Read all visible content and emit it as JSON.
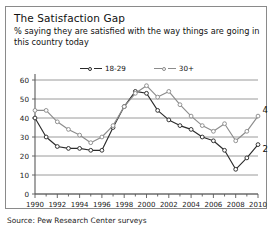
{
  "card": {
    "title": "The Satisfaction Gap",
    "subtitle": "% saying they are satisfied with the way things are going in this country today",
    "source": "Source: Pew Research Center surveys"
  },
  "colors": {
    "series_young": "#2b2b2b",
    "series_older": "#8c8c8c",
    "gridline": "#8f8f8f",
    "axis": "#5a5a5a",
    "border": "#8a8a8a",
    "text": "#111111",
    "background": "#ffffff"
  },
  "legend": {
    "position": "top-center",
    "entries": [
      {
        "label": "18-29",
        "marker": "open-circle",
        "color": "#2b2b2b"
      },
      {
        "label": "30+",
        "marker": "open-circle",
        "color": "#8c8c8c"
      }
    ]
  },
  "chart_data": {
    "type": "line",
    "title": "The Satisfaction Gap",
    "subtitle": "% saying they are satisfied with the way things are going in this country today",
    "xlabel": "",
    "ylabel": "",
    "xlim": [
      1990,
      2010
    ],
    "ylim": [
      0,
      60
    ],
    "yticks": [
      0,
      10,
      20,
      30,
      40,
      50,
      60
    ],
    "xticks": [
      1990,
      1992,
      1994,
      1996,
      1998,
      2000,
      2002,
      2004,
      2006,
      2008,
      2010
    ],
    "xtick_labels": [
      "1990",
      "1992",
      "1994",
      "1996",
      "1998",
      "2000",
      "2002",
      "2004",
      "2006",
      "2008",
      "2010"
    ],
    "ytick_labels": [
      "0",
      "10",
      "20",
      "30",
      "40",
      "50",
      "60"
    ],
    "grid": "horizontal",
    "legend": "top-center",
    "x": [
      1990,
      1991,
      1992,
      1993,
      1994,
      1995,
      1996,
      1997,
      1998,
      1999,
      2000,
      2001,
      2002,
      2003,
      2004,
      2005,
      2006,
      2007,
      2008,
      2009,
      2010
    ],
    "series": [
      {
        "name": "18-29",
        "color": "#2b2b2b",
        "values": [
          40,
          30,
          25,
          24,
          24,
          23,
          23,
          35,
          46,
          54,
          53,
          44,
          39,
          36,
          34,
          30,
          28,
          23,
          13,
          19,
          26
        ],
        "end_label": "26"
      },
      {
        "name": "30+",
        "color": "#8c8c8c",
        "values": [
          44,
          44,
          38,
          34,
          31,
          27,
          30,
          36,
          46,
          53,
          57,
          51,
          54,
          47,
          41,
          36,
          33,
          37,
          28,
          33,
          41
        ],
        "end_label": "41"
      }
    ],
    "annotations": [
      {
        "text": "41",
        "series": "30+",
        "x": 2010,
        "value": 41
      },
      {
        "text": "26",
        "series": "18-29",
        "x": 2010,
        "value": 26
      }
    ]
  }
}
